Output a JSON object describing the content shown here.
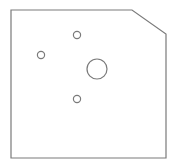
{
  "drawing": {
    "width": 174,
    "height": 165,
    "background": "#ffffff",
    "stroke_color": "#7a7a7a",
    "stroke_width": 1.2,
    "plate_outline": {
      "points": "11,10 132,10 166,34 166,158 11,158"
    },
    "holes": [
      {
        "name": "top-small-hole",
        "cx": 77,
        "cy": 35,
        "r": 3.6
      },
      {
        "name": "left-small-hole",
        "cx": 41,
        "cy": 55,
        "r": 3.6
      },
      {
        "name": "center-large-hole",
        "cx": 97,
        "cy": 69,
        "r": 10
      },
      {
        "name": "bottom-small-hole",
        "cx": 77,
        "cy": 99,
        "r": 3.6
      }
    ]
  }
}
